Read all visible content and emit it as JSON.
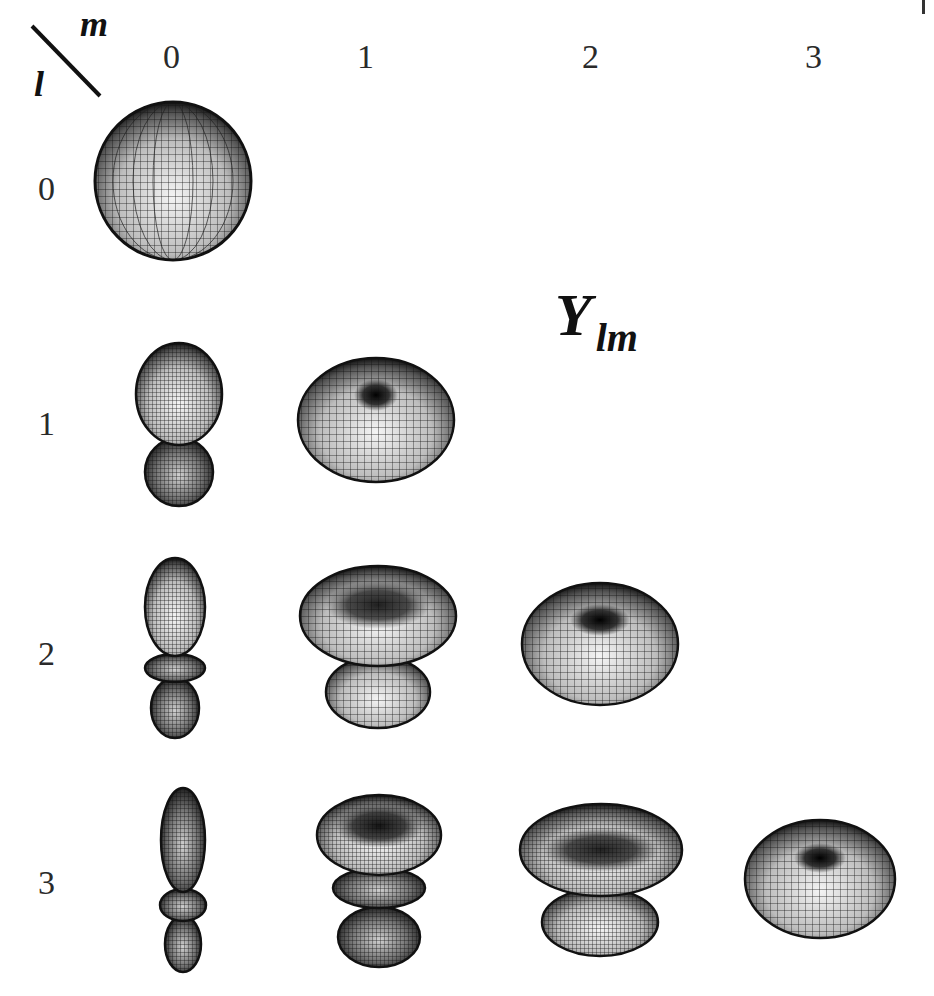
{
  "figure": {
    "title_main": "Y",
    "title_sub": "lm",
    "corner_label_m": "m",
    "corner_label_l": "l",
    "column_headers": [
      "0",
      "1",
      "2",
      "3"
    ],
    "row_labels": [
      "0",
      "1",
      "2",
      "3"
    ],
    "colors": {
      "background": "#ffffff",
      "mesh_line": "#111111",
      "text": "#2a2a2a"
    }
  },
  "harmonics": [
    {
      "l": 0,
      "m": 0,
      "label": "Y00",
      "shape": "sphere"
    },
    {
      "l": 1,
      "m": 0,
      "label": "Y10",
      "shape": "two-lobe dumbbell"
    },
    {
      "l": 1,
      "m": 1,
      "label": "Y11",
      "shape": "torus/donut"
    },
    {
      "l": 2,
      "m": 0,
      "label": "Y20",
      "shape": "elongated lobes with ring"
    },
    {
      "l": 2,
      "m": 1,
      "label": "Y21",
      "shape": "bowl on lobe"
    },
    {
      "l": 2,
      "m": 2,
      "label": "Y22",
      "shape": "torus/donut"
    },
    {
      "l": 3,
      "m": 0,
      "label": "Y30",
      "shape": "slender lobes with rings"
    },
    {
      "l": 3,
      "m": 1,
      "label": "Y31",
      "shape": "stacked bowl, ring, lobe"
    },
    {
      "l": 3,
      "m": 2,
      "label": "Y32",
      "shape": "bowl on lobe"
    },
    {
      "l": 3,
      "m": 3,
      "label": "Y33",
      "shape": "torus/donut"
    }
  ]
}
